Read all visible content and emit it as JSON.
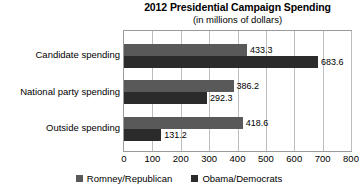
{
  "chart_data": {
    "type": "bar",
    "orientation": "horizontal",
    "title": "2012 Presidential Campaign Spending",
    "subtitle": "(in millions of dollars)",
    "xlabel": "",
    "ylabel": "",
    "xlim": [
      0,
      800
    ],
    "xticks": [
      0,
      100,
      200,
      300,
      400,
      500,
      600,
      700,
      800
    ],
    "xtick_labels": [
      "0",
      "100",
      "200",
      "300",
      "400",
      "500",
      "600",
      "700",
      "800"
    ],
    "grid": true,
    "legend_position": "bottom",
    "categories": [
      "Candidate spending",
      "National party spending",
      "Outside spending"
    ],
    "series": [
      {
        "name": "Romney/Republican",
        "color": "#595959",
        "values": [
          433.3,
          386.2,
          418.6
        ],
        "value_labels": [
          "433.3",
          "386.2",
          "418.6"
        ]
      },
      {
        "name": "Obama/Democrats",
        "color": "#2b2b2b",
        "values": [
          683.6,
          292.3,
          131.2
        ],
        "value_labels": [
          "683.6",
          "292.3",
          "131.2"
        ]
      }
    ]
  }
}
